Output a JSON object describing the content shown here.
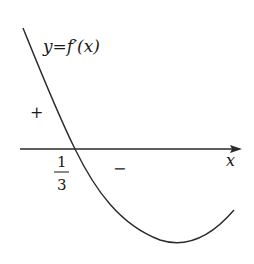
{
  "diagram": {
    "type": "function-graph",
    "curve_label": "y=f′(x)",
    "axis_label": "x",
    "root": {
      "numerator": "1",
      "denominator": "3"
    },
    "sign_left": "+",
    "sign_right": "−",
    "colors": {
      "stroke": "#2a2a2a",
      "text": "#1a1a1a",
      "background": "#ffffff"
    }
  }
}
